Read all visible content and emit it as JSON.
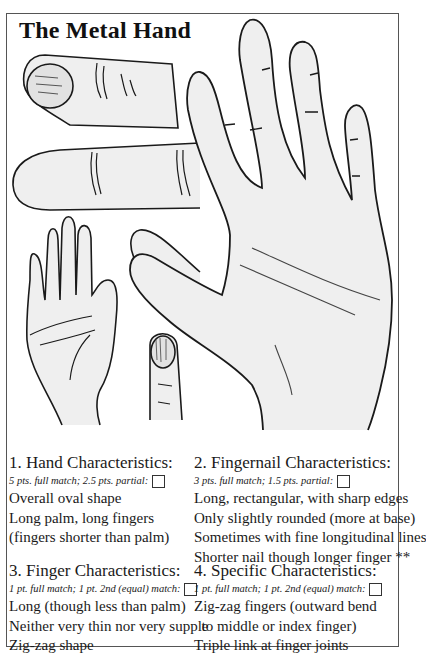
{
  "title": "The Metal Hand",
  "illustrations": {
    "thumb_with_nail": "thumb-drawing",
    "finger_side_view": "finger-side-drawing",
    "small_palm": "small-palm-drawing",
    "fingertip_side": "fingertip-drawing",
    "fingernail_closeup": "fingernail-drawing",
    "large_palm": "large-palm-drawing"
  },
  "sections": [
    {
      "heading": "1. Hand Characteristics:",
      "scoring": "5 pts. full match; 2.5 pts. partial:",
      "items": [
        "Overall oval shape",
        "Long palm, long fingers",
        "(fingers shorter than palm)"
      ]
    },
    {
      "heading": "2. Fingernail Characteristics:",
      "scoring": "3 pts. full match; 1.5 pts. partial:",
      "items": [
        "Long, rectangular, with sharp edges",
        "Only slightly rounded (more at base)",
        "Sometimes with fine longitudinal lines",
        "Shorter nail though longer finger **"
      ]
    },
    {
      "heading": "3. Finger Characteristics:",
      "scoring": "1 pt. full match; 1 pt. 2nd (equal) match:",
      "items": [
        "Long (though less than palm)",
        "Neither very thin nor very supple",
        "Zig-zag shape"
      ]
    },
    {
      "heading": "4. Specific Characteristics:",
      "scoring": "1 pt. full match; 1 pt. 2nd (equal) match:",
      "items": [
        "Zig-zag fingers (outward bend",
        "  to middle or index finger)",
        "Triple link at finger joints"
      ]
    }
  ],
  "colors": {
    "frame": "#555555",
    "ink": "#1a1a1a",
    "skin_shade": "#ececec"
  }
}
